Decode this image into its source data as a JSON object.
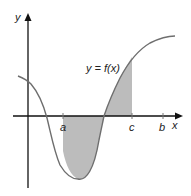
{
  "figure": {
    "type": "area-under-curve diagram",
    "curve_label": "y = f(x)",
    "axes": {
      "x_label": "x",
      "y_label": "y"
    },
    "ticks": [
      {
        "name": "a",
        "label": "a"
      },
      {
        "name": "c",
        "label": "c"
      },
      {
        "name": "b",
        "label": "b"
      }
    ],
    "shaded_region": {
      "from": "a",
      "to": "c",
      "description": "Area between curve and x-axis from a to c (part below axis, part above)"
    },
    "colors": {
      "axis": "#111111",
      "curve": "#6e6e6e",
      "shade": "#bcbcbc",
      "background": "#ffffff"
    }
  }
}
